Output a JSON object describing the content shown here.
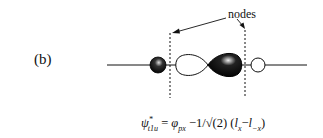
{
  "panel_label": "(b)",
  "annotation": "nodes",
  "formula": {
    "lhs_symbol": "ψ",
    "lhs_sup": "*",
    "lhs_sub": "t1u",
    "equals": "=",
    "phi": "φ",
    "phi_sub": "px",
    "minus_coef": "−1/",
    "sqrt": "√",
    "sqrt_arg": "(2)",
    "paren_open": "(",
    "l1": "l",
    "l1_sub": "x",
    "minus": "−",
    "l2": "l",
    "l2_sub": "−x",
    "paren_close": ")"
  },
  "colors": {
    "ink": "#111111",
    "background": "#ffffff"
  }
}
